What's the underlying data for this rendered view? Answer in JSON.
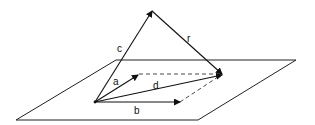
{
  "diagram": {
    "type": "vector-geometry",
    "plane": {
      "label": "",
      "color": "#222222"
    },
    "vectors": [
      {
        "id": "a",
        "label": "a",
        "style": "solid",
        "from": "origin",
        "to": "tip-a"
      },
      {
        "id": "b",
        "label": "b",
        "style": "solid",
        "from": "origin",
        "to": "tip-b"
      },
      {
        "id": "d",
        "label": "d",
        "style": "solid",
        "from": "origin",
        "to": "tip-d"
      },
      {
        "id": "c",
        "label": "c",
        "style": "solid",
        "from": "origin",
        "to": "tip-c"
      },
      {
        "id": "r",
        "label": "r",
        "style": "solid",
        "from": "tip-c",
        "to": "tip-d"
      }
    ],
    "guides": [
      {
        "from": "tip-a",
        "to": "tip-d",
        "style": "dashed"
      },
      {
        "from": "tip-b",
        "to": "tip-d",
        "style": "dashed"
      }
    ],
    "labels": {
      "a": "a",
      "b": "b",
      "c": "c",
      "d": "d",
      "r": "r"
    }
  }
}
